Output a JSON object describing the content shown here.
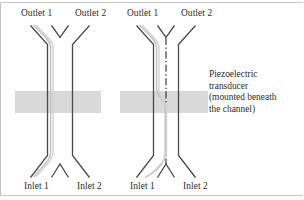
{
  "figure": {
    "type": "schematic-diagram",
    "width": 304,
    "height": 200,
    "background_color": "#ffffff",
    "frame_color": "#c9c6c2"
  },
  "colors": {
    "channel_wall": "#4a4a4a",
    "streamline": "#c3c3c3",
    "centerline": "#3a3a3a",
    "transducer_fill": "#d9d9d9",
    "text": "#2e2b28"
  },
  "panels": [
    {
      "id": "left",
      "name": "transducer-off",
      "labels": {
        "outlet_left": "Outlet 1",
        "outlet_right": "Outlet 2",
        "inlet_left": "Inlet 1",
        "inlet_right": "Inlet 2"
      },
      "has_centerline": false,
      "streamline_description": "particle stream stays along the left wall from Inlet 1 to Outlet 1"
    },
    {
      "id": "right",
      "name": "transducer-on",
      "labels": {
        "outlet_left": "Outlet 1",
        "outlet_right": "Outlet 2",
        "inlet_left": "Inlet 1",
        "inlet_right": "Inlet 2"
      },
      "has_centerline": true,
      "streamline_description": "particle stream migrates from the left wall to the channel centerline across the transducer region"
    }
  ],
  "transducer": {
    "label_lines": [
      "Piezoelectric",
      "transducer",
      "(mounted beneath",
      "the channel)"
    ],
    "fill_color": "#d9d9d9"
  }
}
